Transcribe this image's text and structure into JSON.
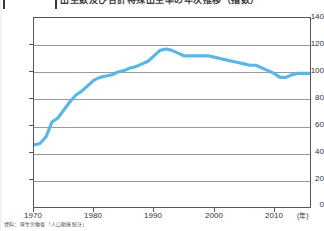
{
  "title": {
    "text": "出生数及び合計特殊出生率の年次推移（指数）",
    "visible_clipped": true
  },
  "footnote": "資料：厚生労働省「人口動態統計」",
  "chart_data": {
    "type": "line",
    "title": "出生数及び合計特殊出生率の年次推移（指数）",
    "xlabel": "年",
    "ylabel": "",
    "xlim": [
      1970,
      2016
    ],
    "ylim": [
      0,
      140
    ],
    "grid": true,
    "legend": "none",
    "line_color": "#5ab6e4",
    "x_ticks": [
      1970,
      1980,
      1990,
      2000,
      2010
    ],
    "x_tick_labels": [
      "1970",
      "1980",
      "1990",
      "2000",
      "2010"
    ],
    "x_unit_label": "(年)",
    "y_ticks": [
      0,
      20,
      40,
      60,
      80,
      100,
      120,
      140
    ],
    "y_tick_labels": [
      "0",
      "20",
      "40",
      "60",
      "80",
      "100",
      "120",
      "140"
    ],
    "series": [
      {
        "name": "指数",
        "x": [
          1970,
          1971,
          1972,
          1973,
          1974,
          1975,
          1976,
          1977,
          1978,
          1979,
          1980,
          1981,
          1982,
          1983,
          1984,
          1985,
          1986,
          1987,
          1988,
          1989,
          1990,
          1991,
          1992,
          1993,
          1994,
          1995,
          1996,
          1997,
          1998,
          1999,
          2000,
          2001,
          2002,
          2003,
          2004,
          2005,
          2006,
          2007,
          2008,
          2009,
          2010,
          2011,
          2012,
          2013,
          2014,
          2015,
          2016
        ],
        "values": [
          46,
          47,
          52,
          63,
          66,
          72,
          78,
          83,
          86,
          90,
          94,
          96,
          97,
          98,
          100,
          101,
          103,
          104,
          106,
          108,
          112,
          116,
          117,
          116,
          114,
          112,
          112,
          112,
          112,
          112,
          111,
          110,
          109,
          108,
          107,
          106,
          105,
          105,
          103,
          101,
          99,
          96,
          96,
          98,
          99,
          99,
          99
        ]
      }
    ]
  }
}
